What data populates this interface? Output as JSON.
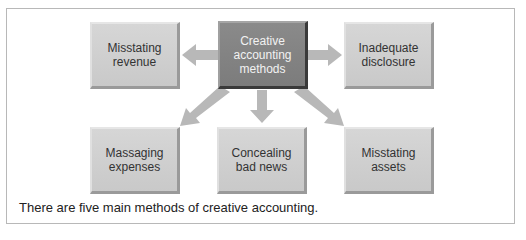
{
  "diagram": {
    "center": {
      "label": "Creative\naccounting\nmethods"
    },
    "nodes": [
      {
        "id": "misstating-revenue",
        "label": "Misstating\nrevenue"
      },
      {
        "id": "inadequate-disclosure",
        "label": "Inadequate\ndisclosure"
      },
      {
        "id": "massaging-expenses",
        "label": "Massaging\nexpenses"
      },
      {
        "id": "concealing-bad-news",
        "label": "Concealing\nbad news"
      },
      {
        "id": "misstating-assets",
        "label": "Misstating\nassets"
      }
    ],
    "edges": [
      {
        "from": "center",
        "to": "misstating-revenue"
      },
      {
        "from": "center",
        "to": "inadequate-disclosure"
      },
      {
        "from": "center",
        "to": "massaging-expenses"
      },
      {
        "from": "center",
        "to": "concealing-bad-news"
      },
      {
        "from": "center",
        "to": "misstating-assets"
      }
    ],
    "caption": "There are five main methods of creative accounting.",
    "colors": {
      "center_fill": "#808080",
      "node_fill": "#cfcfcf",
      "arrow": "#b4b4b4",
      "frame": "#b8b8b8"
    }
  }
}
